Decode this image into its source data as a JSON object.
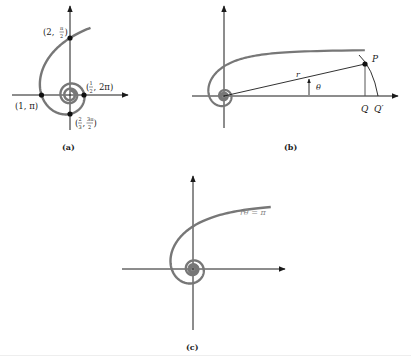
{
  "figure": {
    "colors": {
      "axis": "#1a1a1a",
      "spiral": "#777777",
      "point": "#111111",
      "text": "#222222",
      "equation_text": "#888888"
    },
    "panels": [
      {
        "id": "a",
        "caption": "(a)",
        "points": [
          {
            "label_r": "2",
            "label_theta_num": "π",
            "label_theta_den": "2",
            "label": "(2, π/2)"
          },
          {
            "label": "(1, π)",
            "text": "(1, π)"
          },
          {
            "label_r_num": "1",
            "label_r_den": "2",
            "label_theta": "2π",
            "label": "(1/2, 2π)"
          },
          {
            "label_r_num": "2",
            "label_r_den": "3",
            "label_theta_num": "3π",
            "label_theta_den": "2",
            "label": "(2/3, 3π/2)"
          }
        ]
      },
      {
        "id": "b",
        "caption": "(b)",
        "labels": {
          "P": "P",
          "r": "r",
          "theta": "θ",
          "Q": "Q",
          "Q_prime": "Q′"
        }
      },
      {
        "id": "c",
        "caption": "(c)",
        "equation": "rθ = π"
      }
    ]
  }
}
